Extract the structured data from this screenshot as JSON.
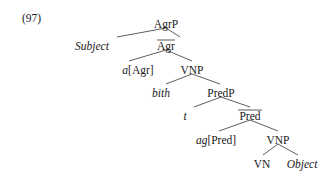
{
  "example_number": "(97)",
  "nodes": [
    {
      "id": "AgrP",
      "label": "AgrP",
      "x": 166,
      "y": 24,
      "italic": false,
      "bar": false
    },
    {
      "id": "Subject",
      "label": "Subject",
      "x": 92,
      "y": 46,
      "italic": true,
      "bar": false
    },
    {
      "id": "Agr",
      "label": "Agr",
      "x": 166,
      "y": 46,
      "italic": false,
      "bar": true
    },
    {
      "id": "aAgr",
      "label_italic": "a",
      "label_rest": "[Agr]",
      "x": 138,
      "y": 70,
      "mixed": true
    },
    {
      "id": "VNP1",
      "label": "VNP",
      "x": 192,
      "y": 70,
      "italic": false,
      "bar": false
    },
    {
      "id": "bith",
      "label": "bith",
      "x": 161,
      "y": 93,
      "italic": true,
      "bar": false
    },
    {
      "id": "PredP",
      "label": "PredP",
      "x": 221,
      "y": 93,
      "italic": false,
      "bar": false
    },
    {
      "id": "t",
      "label": "t",
      "x": 185,
      "y": 116,
      "italic": true,
      "bar": false
    },
    {
      "id": "Pred",
      "label": "Pred",
      "x": 250,
      "y": 116,
      "italic": false,
      "bar": true
    },
    {
      "id": "agPred",
      "label_italic": "ag",
      "label_rest": "[Pred]",
      "x": 216,
      "y": 140,
      "mixed": true
    },
    {
      "id": "VNP2",
      "label": "VNP",
      "x": 278,
      "y": 140,
      "italic": false,
      "bar": false
    },
    {
      "id": "VN",
      "label": "VN",
      "x": 262,
      "y": 164,
      "italic": false,
      "bar": false
    },
    {
      "id": "Object",
      "label": "Object",
      "x": 302,
      "y": 164,
      "italic": true,
      "bar": false
    }
  ],
  "edges": [
    [
      166,
      28,
      117,
      37
    ],
    [
      166,
      28,
      180,
      37
    ],
    [
      166,
      50,
      129,
      61
    ],
    [
      166,
      50,
      192,
      61
    ],
    [
      192,
      74,
      166,
      84
    ],
    [
      192,
      74,
      220,
      84
    ],
    [
      221,
      97,
      194,
      107
    ],
    [
      221,
      97,
      250,
      107
    ],
    [
      250,
      120,
      219,
      131
    ],
    [
      250,
      120,
      278,
      131
    ],
    [
      278,
      144,
      263,
      155
    ],
    [
      278,
      144,
      298,
      155
    ]
  ]
}
